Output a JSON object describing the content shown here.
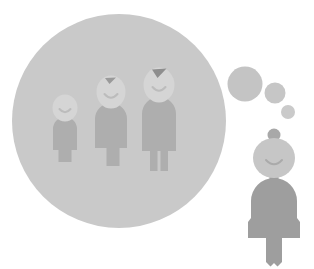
{
  "illustration": {
    "title": "Woman remembering her childhood",
    "caption": "A woman thinking back, with a thought bubble containing a memory of three growing children",
    "background_color": "#ffffff",
    "canvas": {
      "width": 314,
      "height": 269
    }
  },
  "palette": {
    "memory_bubble": "#c9c9c9",
    "memory_figure_body": "#aeaeae",
    "memory_figure_head": "#d5d5d5",
    "memory_figure_hair": "#9a9a9a",
    "memory_figure_face_line": "#b9b9b9",
    "thought_dot": "#c4c4c4",
    "person_body": "#9e9e9e",
    "person_head": "#c6c6c6",
    "person_hair_bun": "#a8a8a8",
    "person_face_line": "#aaaaaa"
  },
  "memory_bubble": {
    "label": "memory thought bubble",
    "shape": "circle",
    "cx": 119,
    "cy": 121,
    "r": 107,
    "fill": "#c9c9c9"
  },
  "thought_dots": [
    {
      "label": "thought dot large",
      "cx": 245,
      "cy": 84,
      "r": 17.5,
      "fill": "#c4c4c4"
    },
    {
      "label": "thought dot medium",
      "cx": 275,
      "cy": 93,
      "r": 10.5,
      "fill": "#c6c6c6"
    },
    {
      "label": "thought dot small",
      "cx": 288,
      "cy": 112,
      "r": 7.0,
      "fill": "#cacaca"
    }
  ],
  "memory_figures": [
    {
      "id": "child",
      "label": "small child figure",
      "age_stage": "child",
      "has_hair_tuft": false,
      "head": {
        "cx": 65,
        "cy": 108,
        "rx": 12.5,
        "ry": 13.5
      },
      "body": {
        "x": 53,
        "y": 118,
        "width": 24,
        "height": 32,
        "shoulder_radius": 11
      },
      "legs": {
        "gap": 3.5,
        "length": 12,
        "width": 8
      },
      "face": {
        "mouth": "smile",
        "eyes": "closed"
      }
    },
    {
      "id": "teen",
      "label": "middle child figure",
      "age_stage": "teen",
      "has_hair_tuft": true,
      "head": {
        "cx": 111,
        "cy": 92,
        "rx": 14.5,
        "ry": 16.5
      },
      "body": {
        "x": 95,
        "y": 105,
        "width": 32,
        "height": 43,
        "shoulder_radius": 14
      },
      "legs": {
        "gap": 4,
        "length": 16,
        "width": 11
      },
      "face": {
        "mouth": "smile",
        "eyes": "closed"
      }
    },
    {
      "id": "adult",
      "label": "tall child figure",
      "age_stage": "young adult",
      "has_hair_tuft": true,
      "head": {
        "cx": 159,
        "cy": 85,
        "rx": 15.5,
        "ry": 17.5
      },
      "body": {
        "x": 142,
        "y": 99,
        "width": 34,
        "height": 52,
        "shoulder_radius": 15
      },
      "legs": {
        "gap": 4,
        "length": 18,
        "width": 12
      },
      "face": {
        "mouth": "smile",
        "eyes": "closed"
      }
    }
  ],
  "person": {
    "label": "woman figure",
    "hair_bun": {
      "cx": 274,
      "cy": 135,
      "r": 6.5
    },
    "head": {
      "cx": 274,
      "cy": 158,
      "rx": 21,
      "ry": 20
    },
    "neck": {
      "x": 270,
      "y": 173,
      "width": 8,
      "height": 10
    },
    "body": {
      "x": 251,
      "y": 180,
      "width": 46,
      "height": 58,
      "shoulder_radius": 21
    },
    "skirt": {
      "flare": 7,
      "hem_y": 238
    },
    "legs": {
      "gap": 4,
      "length": 28,
      "width": 13
    },
    "face": {
      "mouth": "smile",
      "eyes": "closed"
    }
  }
}
